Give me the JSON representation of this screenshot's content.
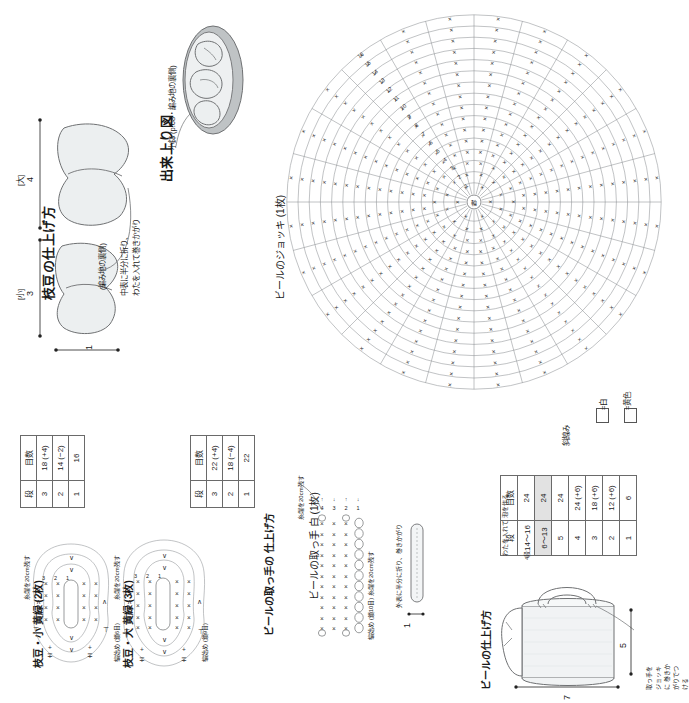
{
  "sections": {
    "edamame_finish": {
      "title": "枝豆の仕上げ方",
      "label_small": "[小]",
      "label_large": "[大]",
      "dim_small": "3",
      "dim_large": "4",
      "dim_width": "1",
      "note_back": "(編み地の裏側)",
      "note_fold": "中表に半分に折り、",
      "note_stuff": "わたを入れて巻きかがり"
    },
    "finished_view": {
      "title": "出来上り図",
      "caption": "小鉢 (p.68・編み地の裏側)"
    },
    "mug_chart": {
      "title": "ビールのジョッキ (1枚)",
      "round_numbers": [
        "1",
        "2",
        "3",
        "4",
        "5",
        "6",
        "7",
        "8",
        "9",
        "10",
        "11",
        "12",
        "13",
        "14",
        "15",
        "16"
      ],
      "stitch_symbol": "×"
    },
    "legend": {
      "items": [
        {
          "swatch": "□",
          "label": "=白"
        },
        {
          "swatch": "□",
          "label": "=黄色"
        }
      ]
    },
    "edamame_small": {
      "title": "枝豆・小 黄緑 (2枚)",
      "note_tail": "糸端を20cm残す",
      "note_start": "編始め (鎖6目)",
      "round_labels": [
        "1",
        "2",
        "3"
      ]
    },
    "edamame_large": {
      "title": "枝豆・大 黄緑 (3枚)",
      "note_tail": "糸端を20cm残す",
      "note_start": "編始め (鎖9目)",
      "round_labels": [
        "1",
        "2",
        "3"
      ]
    },
    "handle_chart": {
      "title": "ビールの取っ手 白 (1枚)",
      "note_tail": "糸端を20cm残す",
      "note_start": "編始め (鎖10目) 糸端を20cm残す",
      "row_labels": [
        "1",
        "2",
        "3",
        "4"
      ]
    },
    "handle_finish": {
      "title": "ビールの取っ手の 仕上げ方",
      "dim": "1",
      "note": "外表に半分に折り、巻きかがり"
    },
    "mug_finish": {
      "title": "ビールの仕上げ方",
      "dim_h": "5",
      "dim_w": "7",
      "note_stuff": "わたを入れて 泡を作る",
      "note_row": "4段",
      "note_handle": "取っ手をジョッキに 巻きかがりでつける"
    }
  },
  "tables": {
    "edamame_small": {
      "headers": [
        "段",
        "目数"
      ],
      "rows": [
        [
          "3",
          "18 (+4)"
        ],
        [
          "2",
          "14 (−2)"
        ],
        [
          "1",
          "16"
        ]
      ]
    },
    "edamame_large": {
      "headers": [
        "段",
        "目数"
      ],
      "rows": [
        [
          "3",
          "22 (+4)"
        ],
        [
          "2",
          "18 (−4)"
        ],
        [
          "1",
          "22"
        ]
      ]
    },
    "mug": {
      "headers": [
        "段",
        "目数"
      ],
      "rows": [
        [
          "14〜16",
          "24",
          false
        ],
        [
          "6〜13",
          "24",
          true
        ],
        [
          "5",
          "24",
          false
        ],
        [
          "4",
          "24 (+6)",
          false
        ],
        [
          "3",
          "18 (+6)",
          false
        ],
        [
          "2",
          "12 (+6)",
          false
        ],
        [
          "1",
          "6",
          false
        ]
      ],
      "side_note": "斜線み"
    }
  },
  "colors": {
    "ink": "#1a1a1a",
    "line": "#6f7173",
    "fill_light": "#eceff0",
    "fill_mug": "#f1f3f4",
    "highlight": "#e2e2e2"
  }
}
